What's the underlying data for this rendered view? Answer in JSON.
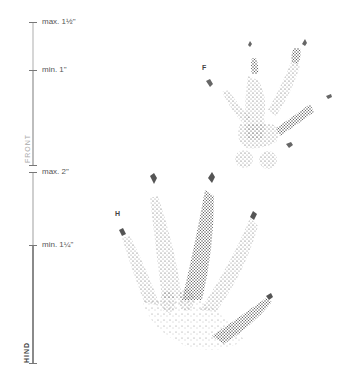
{
  "scale": {
    "front": {
      "label": "FRONT",
      "max_label": "max. 1½\"",
      "min_label": "min. 1\"",
      "color": "#bdbdbd"
    },
    "hind": {
      "label": "HIND",
      "max_label": "max. 2\"",
      "min_label": "min. 1¼\"",
      "color": "#8a8a8a",
      "range_color": "#c8c8c8"
    }
  },
  "tracks": {
    "front": {
      "letter": "F",
      "name": "front-foot-track"
    },
    "hind": {
      "letter": "H",
      "name": "hind-foot-track"
    }
  }
}
